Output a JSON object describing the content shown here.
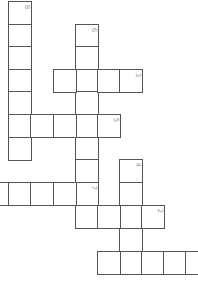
{
  "puzzle": {
    "type": "crossword",
    "orientation": "rotated 90 degrees",
    "cell_size_px": 22,
    "line_color": "#555555",
    "number_color": "#999999",
    "words": [
      {
        "number": "8",
        "direction": "down",
        "cells": [
          [
            8,
            1
          ],
          [
            8,
            24
          ],
          [
            8,
            46
          ],
          [
            8,
            69
          ],
          [
            8,
            91
          ],
          [
            8,
            114
          ],
          [
            8,
            137
          ]
        ],
        "number_cell": 0
      },
      {
        "number": "6",
        "direction": "down",
        "cells": [
          [
            75,
            24
          ],
          [
            75,
            46
          ],
          [
            75,
            69
          ],
          [
            75,
            91
          ],
          [
            75,
            114
          ],
          [
            75,
            137
          ],
          [
            75,
            159
          ],
          [
            75,
            182
          ],
          [
            75,
            205
          ]
        ],
        "number_cell": 0
      },
      {
        "number": "3",
        "direction": "across",
        "cells": [
          [
            53,
            69
          ],
          [
            75,
            69
          ],
          [
            97,
            69
          ],
          [
            119,
            69
          ]
        ],
        "number_cell": 3
      },
      {
        "number": "5",
        "direction": "across",
        "cells": [
          [
            8,
            114
          ],
          [
            30,
            114
          ],
          [
            53,
            114
          ],
          [
            75,
            114
          ],
          [
            97,
            114
          ]
        ],
        "number_cell": 4
      },
      {
        "number": "4",
        "direction": "down",
        "cells": [
          [
            119,
            159
          ],
          [
            119,
            182
          ],
          [
            119,
            205
          ],
          [
            119,
            228
          ],
          [
            119,
            251
          ]
        ],
        "number_cell": 0
      },
      {
        "number": "7",
        "direction": "across",
        "cells": [
          [
            -14,
            182
          ],
          [
            8,
            182
          ],
          [
            30,
            182
          ],
          [
            53,
            182
          ],
          [
            75,
            182
          ]
        ],
        "number_cell": 4
      },
      {
        "number": "2",
        "direction": "across",
        "cells": [
          [
            75,
            205
          ],
          [
            97,
            205
          ],
          [
            119,
            205
          ],
          [
            141,
            205
          ]
        ],
        "number_cell": 3
      },
      {
        "number": "",
        "direction": "across",
        "cells": [
          [
            97,
            251
          ],
          [
            119,
            251
          ],
          [
            141,
            251
          ],
          [
            163,
            251
          ],
          [
            185,
            251
          ]
        ],
        "number_cell": -1
      }
    ]
  }
}
